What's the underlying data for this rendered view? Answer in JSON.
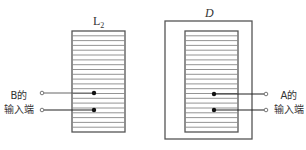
{
  "diagram": {
    "left_coil": {
      "label": "L",
      "label_subscript": "2",
      "terminal_label_line1": "B的",
      "terminal_label_line2": "输入端",
      "winding_lines": 20
    },
    "right_device": {
      "label": "D",
      "terminal_label_line1": "A的",
      "terminal_label_line2": "输入端",
      "winding_lines": 20
    },
    "colors": {
      "stroke": "#555555",
      "dark": "#111111",
      "background": "#ffffff"
    }
  }
}
